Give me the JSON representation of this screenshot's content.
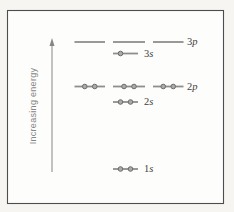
{
  "figure": {
    "name": "orbital-energy-level-diagram",
    "frame": {
      "x": 7,
      "y": 10,
      "width": 217,
      "height": 194
    },
    "inner_background": "#fdfdfb"
  },
  "colors": {
    "frame_border": "#4d4d4d",
    "orbital_line": "#8e8e8e",
    "electron_fill": "#ababab",
    "electron_stroke": "#6b6b6b",
    "level_label": "#3e3e3e",
    "axis": "#868686"
  },
  "axis": {
    "label": "Increasing energy",
    "x": 52,
    "y_tip": 38,
    "y_head_base": 46,
    "y_bottom": 172,
    "label_x": 36,
    "label_y": 106
  },
  "geometry": {
    "electron_slot_offset": 5,
    "electron_radius": 2.3,
    "line_thickness": 1.8,
    "label_baseline_shift": 3.2
  },
  "levels": [
    {
      "name": "3p",
      "label_num": "3",
      "label_letter": "p",
      "y": 42,
      "label_x": 187,
      "orbitals": [
        {
          "x1": 74.5,
          "x2": 105,
          "electrons": 0
        },
        {
          "x1": 113,
          "x2": 145,
          "electrons": 0
        },
        {
          "x1": 153,
          "x2": 183.5,
          "electrons": 0
        }
      ]
    },
    {
      "name": "3s",
      "label_num": "3",
      "label_letter": "s",
      "y": 53.5,
      "label_x": 144,
      "orbitals": [
        {
          "x1": 113,
          "x2": 138,
          "electrons": 1
        }
      ]
    },
    {
      "name": "2p",
      "label_num": "2",
      "label_letter": "p",
      "y": 86.5,
      "label_x": 187,
      "orbitals": [
        {
          "x1": 74.5,
          "x2": 105,
          "electrons": 2
        },
        {
          "x1": 113,
          "x2": 145,
          "electrons": 2
        },
        {
          "x1": 153,
          "x2": 183.5,
          "electrons": 2
        }
      ]
    },
    {
      "name": "2s",
      "label_num": "2",
      "label_letter": "s",
      "y": 102,
      "label_x": 144,
      "orbitals": [
        {
          "x1": 113,
          "x2": 138,
          "electrons": 2
        }
      ]
    },
    {
      "name": "1s",
      "label_num": "1",
      "label_letter": "s",
      "y": 169,
      "label_x": 144,
      "orbitals": [
        {
          "x1": 113,
          "x2": 138,
          "electrons": 2
        }
      ]
    }
  ]
}
